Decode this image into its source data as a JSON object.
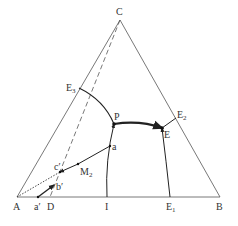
{
  "diagram": {
    "type": "ternary-phase-diagram",
    "vertices": {
      "A": {
        "label": "A",
        "x": 17,
        "y": 197
      },
      "B": {
        "label": "B",
        "x": 220,
        "y": 197
      },
      "C": {
        "label": "C",
        "x": 120,
        "y": 20
      }
    },
    "labels": {
      "C": "C",
      "A": "A",
      "B": "B",
      "E3": "E",
      "E3_sub": "3",
      "E2": "E",
      "E2_sub": "2",
      "E1": "E",
      "E1_sub": "1",
      "P": "P",
      "E": "E",
      "a": "a",
      "M2": "M",
      "M2_sub": "2",
      "c_prime": "c′",
      "b_prime": "b′",
      "a_prime": "a′",
      "D": "D",
      "I": "I"
    },
    "colors": {
      "line": "#444444",
      "thick": "#222222",
      "text": "#333333"
    }
  }
}
